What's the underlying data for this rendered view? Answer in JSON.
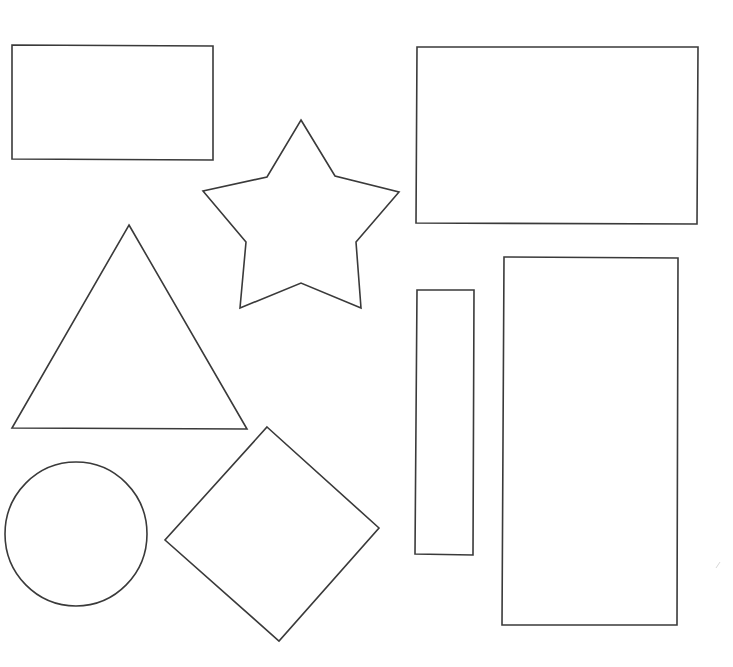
{
  "diagram": {
    "width": 733,
    "height": 667,
    "background": "#ffffff",
    "stroke_color": "#3a3a3a",
    "fill_color": "#ffffff",
    "shapes": [
      {
        "name": "rectangle-top-left",
        "type": "polygon",
        "points": "12,45 213,46 213,160 12,159"
      },
      {
        "name": "star",
        "type": "polygon",
        "points": "301,120 335,176 399,192 356,242 361,308 301,283 240,308 246,242 203,191 267,177"
      },
      {
        "name": "rectangle-top-right",
        "type": "polygon",
        "points": "417,47 698,47 697,224 416,223"
      },
      {
        "name": "triangle",
        "type": "polygon",
        "points": "129,225 247,429 12,428"
      },
      {
        "name": "rectangle-narrow",
        "type": "polygon",
        "points": "417,290 474,290 473,555 415,554"
      },
      {
        "name": "rectangle-tall",
        "type": "polygon",
        "points": "504,257 678,258 677,625 502,625"
      },
      {
        "name": "circle",
        "type": "ellipse",
        "cx": 76,
        "cy": 534,
        "rx": 71,
        "ry": 72
      },
      {
        "name": "diamond",
        "type": "polygon",
        "points": "267,427 379,528 279,641 165,540"
      }
    ]
  }
}
